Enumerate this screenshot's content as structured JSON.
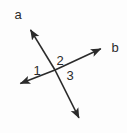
{
  "figure": {
    "type": "geometry-diagram",
    "background_color": "#fdfdfd",
    "stroke_color": "#2b2b2b",
    "text_color": "#2b2b2b",
    "canvas": {
      "width": 127,
      "height": 133
    },
    "intersection_point": {
      "x": 55,
      "y": 70
    },
    "lines": [
      {
        "name": "line-a",
        "label": "a",
        "label_position": {
          "x": 18,
          "y": 14
        },
        "start": {
          "x": 82,
          "y": 124
        },
        "end": {
          "x": 27,
          "y": 24
        },
        "arrow_start": true,
        "arrow_end": true
      },
      {
        "name": "line-b",
        "label": "b",
        "label_position": {
          "x": 115,
          "y": 47
        },
        "start": {
          "x": 14,
          "y": 86
        },
        "end": {
          "x": 107,
          "y": 46
        },
        "arrow_start": true,
        "arrow_end": true
      }
    ],
    "angle_labels": [
      {
        "name": "angle-1",
        "label": "1",
        "position": {
          "x": 37,
          "y": 70
        }
      },
      {
        "name": "angle-2",
        "label": "2",
        "position": {
          "x": 60,
          "y": 60
        }
      },
      {
        "name": "angle-3",
        "label": "3",
        "position": {
          "x": 70,
          "y": 75
        }
      }
    ]
  }
}
